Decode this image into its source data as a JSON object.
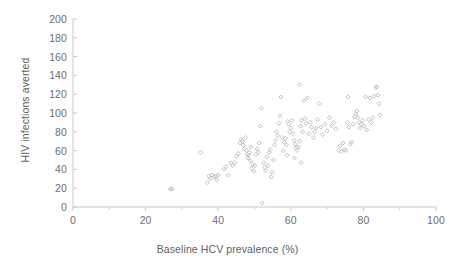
{
  "chart_data": {
    "type": "scatter",
    "title": "",
    "xlabel": "Baseline HCV prevalence (%)",
    "ylabel": "HIV infections averted",
    "xlim": [
      0,
      100
    ],
    "ylim": [
      0,
      200
    ],
    "xticks": [
      0,
      20,
      40,
      60,
      80,
      100
    ],
    "yticks": [
      0,
      20,
      40,
      60,
      80,
      100,
      120,
      140,
      160,
      180,
      200
    ],
    "xtick_labels": [
      "0",
      "20",
      "40",
      "60",
      "80",
      "100"
    ],
    "ytick_labels": [
      "0",
      "20",
      "40",
      "60",
      "80",
      "100",
      "120",
      "140",
      "160",
      "180",
      "200"
    ],
    "x_minor_tick_interval": 10,
    "grid": false,
    "legend": null,
    "marker": {
      "shape": "open-diamond",
      "size_px": 4,
      "edge_color": "#b9b9b9",
      "fill_color": "none"
    },
    "axis_color": "#c9c9c9",
    "text_color": "#6e6e6e",
    "background": "#ffffff",
    "n_points": 135,
    "series": [
      {
        "name": "simulation runs",
        "points": [
          [
            26.8,
            19
          ],
          [
            27.3,
            19
          ],
          [
            35.2,
            58
          ],
          [
            37.0,
            26
          ],
          [
            37.4,
            33
          ],
          [
            37.8,
            30
          ],
          [
            38.3,
            34
          ],
          [
            38.9,
            32
          ],
          [
            39.3,
            33
          ],
          [
            39.6,
            29
          ],
          [
            40.0,
            34
          ],
          [
            41.6,
            40
          ],
          [
            42.2,
            43
          ],
          [
            42.8,
            34
          ],
          [
            43.4,
            47
          ],
          [
            44.0,
            44
          ],
          [
            44.6,
            47
          ],
          [
            45.6,
            57
          ],
          [
            46.0,
            68
          ],
          [
            46.3,
            72
          ],
          [
            46.6,
            70
          ],
          [
            46.9,
            66
          ],
          [
            47.2,
            62
          ],
          [
            47.5,
            74
          ],
          [
            47.8,
            60
          ],
          [
            48.0,
            56
          ],
          [
            48.2,
            52
          ],
          [
            48.4,
            55
          ],
          [
            48.6,
            58
          ],
          [
            48.9,
            49
          ],
          [
            49.2,
            41
          ],
          [
            49.5,
            45
          ],
          [
            49.8,
            38
          ],
          [
            50.1,
            44
          ],
          [
            50.4,
            56
          ],
          [
            50.7,
            62
          ],
          [
            51.0,
            58
          ],
          [
            51.3,
            68
          ],
          [
            51.6,
            86
          ],
          [
            51.9,
            105
          ],
          [
            52.1,
            4
          ],
          [
            52.5,
            47
          ],
          [
            52.8,
            42
          ],
          [
            53.1,
            39
          ],
          [
            53.4,
            53
          ],
          [
            53.7,
            44
          ],
          [
            54.0,
            58
          ],
          [
            54.3,
            61
          ],
          [
            54.6,
            32
          ],
          [
            54.9,
            37
          ],
          [
            55.2,
            50
          ],
          [
            55.5,
            66
          ],
          [
            55.8,
            71
          ],
          [
            56.1,
            80
          ],
          [
            56.4,
            76
          ],
          [
            56.7,
            89
          ],
          [
            57.0,
            97
          ],
          [
            57.3,
            117
          ],
          [
            57.6,
            74
          ],
          [
            57.9,
            60
          ],
          [
            58.2,
            69
          ],
          [
            58.5,
            73
          ],
          [
            58.8,
            66
          ],
          [
            59.1,
            91
          ],
          [
            59.4,
            88
          ],
          [
            59.7,
            80
          ],
          [
            60.0,
            84
          ],
          [
            60.3,
            92
          ],
          [
            60.6,
            78
          ],
          [
            60.9,
            71
          ],
          [
            61.2,
            67
          ],
          [
            61.5,
            63
          ],
          [
            61.8,
            60
          ],
          [
            62.1,
            64
          ],
          [
            62.4,
            70
          ],
          [
            62.7,
            86
          ],
          [
            62.9,
            92
          ],
          [
            62.4,
            130
          ],
          [
            62.8,
            47
          ],
          [
            63.3,
            80
          ],
          [
            63.6,
            113
          ],
          [
            63.9,
            94
          ],
          [
            64.2,
            89
          ],
          [
            64.6,
            116
          ],
          [
            65.0,
            78
          ],
          [
            65.4,
            90
          ],
          [
            65.8,
            85
          ],
          [
            66.2,
            74
          ],
          [
            66.6,
            80
          ],
          [
            67.0,
            84
          ],
          [
            67.4,
            93
          ],
          [
            67.8,
            110
          ],
          [
            68.3,
            85
          ],
          [
            68.8,
            77
          ],
          [
            69.4,
            88
          ],
          [
            70.0,
            81
          ],
          [
            70.6,
            95
          ],
          [
            71.2,
            86
          ],
          [
            71.8,
            90
          ],
          [
            72.4,
            83
          ],
          [
            73.2,
            60
          ],
          [
            73.6,
            65
          ],
          [
            74.0,
            59
          ],
          [
            74.4,
            68
          ],
          [
            74.8,
            61
          ],
          [
            75.2,
            60
          ],
          [
            75.6,
            90
          ],
          [
            75.8,
            117
          ],
          [
            76.0,
            85
          ],
          [
            76.4,
            67
          ],
          [
            76.8,
            69
          ],
          [
            77.2,
            88
          ],
          [
            77.6,
            96
          ],
          [
            77.9,
            99
          ],
          [
            78.2,
            102
          ],
          [
            78.5,
            95
          ],
          [
            78.8,
            90
          ],
          [
            79.1,
            84
          ],
          [
            79.4,
            88
          ],
          [
            79.8,
            92
          ],
          [
            80.2,
            86
          ],
          [
            80.6,
            117
          ],
          [
            80.9,
            82
          ],
          [
            81.4,
            93
          ],
          [
            81.8,
            116
          ],
          [
            82.2,
            90
          ],
          [
            82.6,
            95
          ],
          [
            83.0,
            118
          ],
          [
            83.4,
            127
          ],
          [
            83.7,
            128
          ],
          [
            84.0,
            119
          ],
          [
            84.3,
            110
          ],
          [
            84.6,
            98
          ],
          [
            59.0,
            55
          ],
          [
            61.0,
            52
          ],
          [
            49.0,
            64
          ],
          [
            45.0,
            54
          ]
        ]
      }
    ]
  }
}
